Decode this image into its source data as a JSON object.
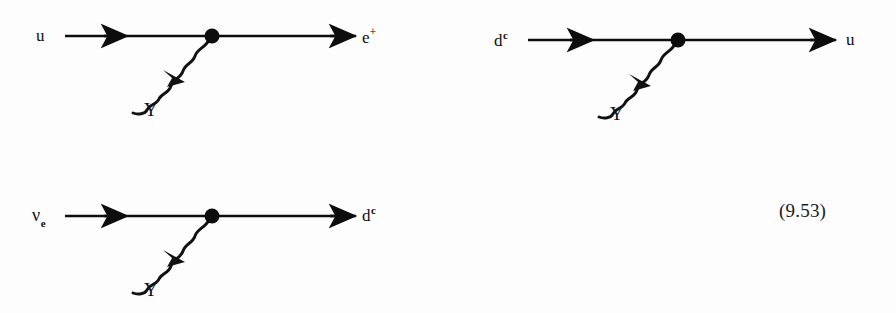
{
  "page": {
    "background_color": "#fdfdfd",
    "ink_color": "#0d0d0d",
    "width": 896,
    "height": 313
  },
  "equation_number": "(9.53)",
  "figure": {
    "caption": "",
    "type": "feynman-diagrams",
    "diagram_count": 3
  },
  "diagrams": [
    {
      "id": "diagram-1",
      "name": "u-to-positron-photon-vertex",
      "incoming_label": {
        "base": "u",
        "sup": "",
        "sub": ""
      },
      "outgoing_label": {
        "base": "e",
        "sup_plain": "+",
        "sub": ""
      },
      "photon_label": "Υ",
      "photon_name": "photon",
      "vertex_name": "interaction-vertex",
      "fermion_arrow_direction": "right",
      "photon_arrow_direction": "toward-vertex"
    },
    {
      "id": "diagram-2",
      "name": "dc-to-u-photon-vertex",
      "incoming_label": {
        "base": "d",
        "sup": "c",
        "sub": ""
      },
      "outgoing_label": {
        "base": "u",
        "sup": "",
        "sub": ""
      },
      "photon_label": "Υ",
      "photon_name": "photon",
      "vertex_name": "interaction-vertex",
      "fermion_arrow_direction": "right",
      "photon_arrow_direction": "toward-vertex"
    },
    {
      "id": "diagram-3",
      "name": "nu-e-to-dc-photon-vertex",
      "incoming_label": {
        "base": "ν",
        "sub": "e",
        "sup": ""
      },
      "outgoing_label": {
        "base": "d",
        "sup": "c",
        "sub": ""
      },
      "photon_label": "Υ",
      "photon_name": "photon",
      "vertex_name": "interaction-vertex",
      "fermion_arrow_direction": "right",
      "photon_arrow_direction": "toward-vertex"
    }
  ]
}
